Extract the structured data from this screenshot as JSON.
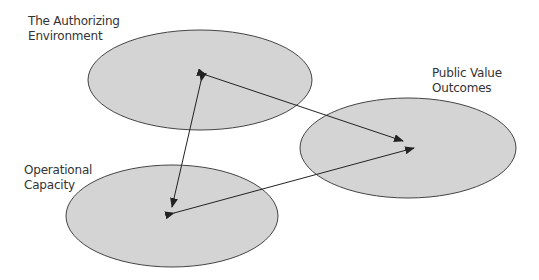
{
  "diagram": {
    "nodes": [
      {
        "id": "authorizing",
        "label_lines": [
          "The Authorizing",
          "Environment"
        ],
        "cx": 200,
        "cy": 80,
        "rx": 112,
        "ry": 50
      },
      {
        "id": "public_value",
        "label_lines": [
          "Public Value",
          "Outcomes"
        ],
        "cx": 408,
        "cy": 148,
        "rx": 108,
        "ry": 50
      },
      {
        "id": "operational",
        "label_lines": [
          "Operational",
          "Capacity"
        ],
        "cx": 172,
        "cy": 216,
        "rx": 106,
        "ry": 51
      }
    ],
    "edges": [
      {
        "from": "authorizing",
        "to": "public_value",
        "bidirectional": true
      },
      {
        "from": "authorizing",
        "to": "operational",
        "bidirectional": true
      },
      {
        "from": "operational",
        "to": "public_value",
        "bidirectional": true
      }
    ],
    "colors": {
      "fill": "#d4d4d4",
      "stroke": "#444444",
      "arrow": "#222222",
      "text": "#333333"
    }
  }
}
